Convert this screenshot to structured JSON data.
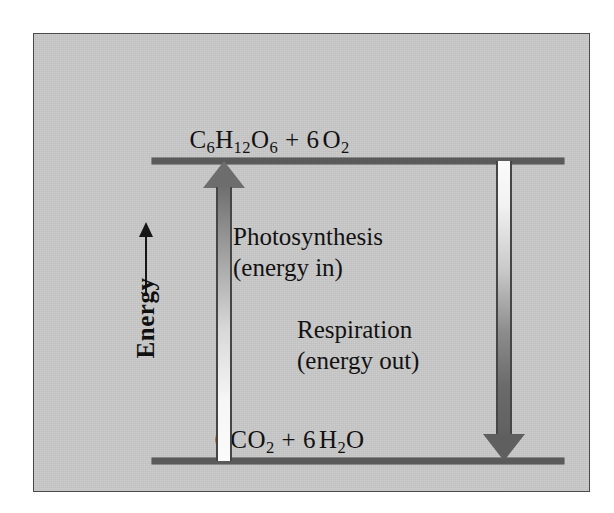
{
  "diagram": {
    "background_color": "#c9c9c9",
    "border_color": "#4a4a4a",
    "line_color": "#5a5a5a",
    "text_color": "#111111",
    "axis": {
      "label": "Energy",
      "arrow_direction": "up",
      "icon": "up-arrow-icon"
    },
    "levels": {
      "top": {
        "formula_parts": {
          "glucose_element_c": "C",
          "glucose_sub_c": "6",
          "glucose_element_h": "H",
          "glucose_sub_h": "12",
          "glucose_element_o": "O",
          "glucose_sub_o": "6",
          "plus": "+",
          "oxygen_coefficient": "6",
          "oxygen_element": "O",
          "oxygen_sub": "2"
        },
        "formula_text": "C6H12O6 + 6 O2"
      },
      "bottom": {
        "formula_parts": {
          "co2_coefficient": "6",
          "co2_element": "CO",
          "co2_sub": "2",
          "plus": "+",
          "h2o_coefficient": "6",
          "h2o_element_h": "H",
          "h2o_sub_h": "2",
          "h2o_element_o": "O"
        },
        "formula_text": "6 CO2 + 6 H2O"
      }
    },
    "processes": [
      {
        "id": "photosynthesis",
        "name": "Photosynthesis",
        "energy_note": "(energy in)",
        "arrow_direction": "up",
        "arrow_icon": "up-arrow-icon",
        "from_level": "6 CO2 + 6 H2O",
        "to_level": "C6H12O6 + 6 O2",
        "gradient_from": "#6f6f6f",
        "gradient_to": "#fbfbfb"
      },
      {
        "id": "respiration",
        "name": "Respiration",
        "energy_note": "(energy out)",
        "arrow_direction": "down",
        "arrow_icon": "down-arrow-icon",
        "from_level": "C6H12O6 + 6 O2",
        "to_level": "6 CO2 + 6 H2O",
        "gradient_from": "#fbfbfb",
        "gradient_to": "#5f5f5f"
      }
    ]
  }
}
